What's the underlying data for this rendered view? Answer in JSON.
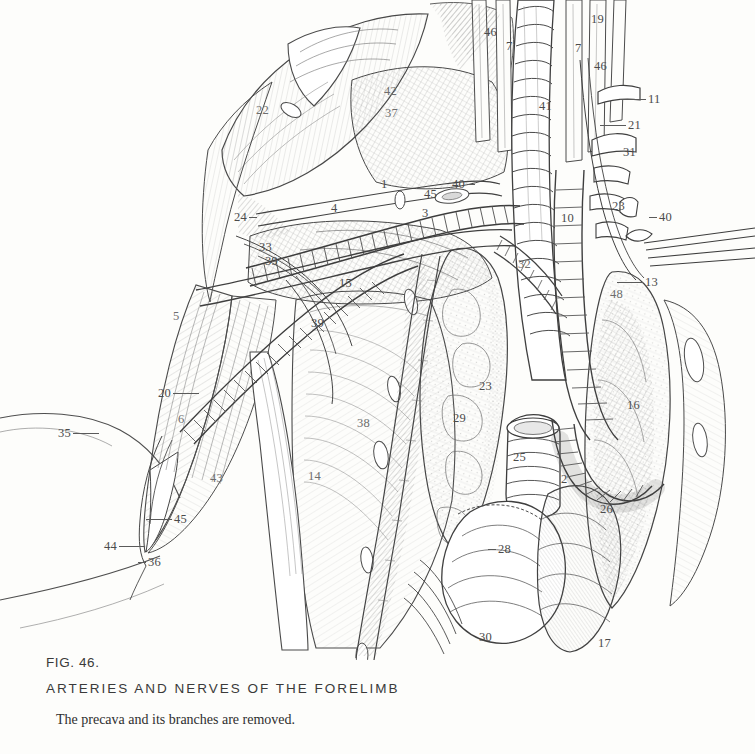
{
  "figure": {
    "number": "FIG. 46.",
    "title": "ARTERIES AND NERVES OF THE FORELIMB",
    "subtitle": "The precava and its branches are removed.",
    "media": "pen-and-ink anatomical line engraving"
  },
  "ink": {
    "line": "#3a3a3a",
    "label": "#4b4b4b",
    "hatch": "#6b6b6b",
    "paper": "#fdfdfb"
  },
  "labels": [
    {
      "id": "l-46a",
      "text": "46",
      "x": 484,
      "y": 26,
      "lead": "lead-r short"
    },
    {
      "id": "l-7a",
      "text": "7",
      "x": 506,
      "y": 40,
      "lead": ""
    },
    {
      "id": "l-19",
      "text": "19",
      "x": 591,
      "y": 13,
      "lead": ""
    },
    {
      "id": "l-7b",
      "text": "7",
      "x": 575,
      "y": 42,
      "lead": ""
    },
    {
      "id": "l-46b",
      "text": "46",
      "x": 594,
      "y": 60,
      "lead": ""
    },
    {
      "id": "l-41",
      "text": "41",
      "x": 539,
      "y": 100,
      "lead": ""
    },
    {
      "id": "l-11",
      "text": "11",
      "x": 648,
      "y": 93,
      "lead": "lead-l long"
    },
    {
      "id": "l-21",
      "text": "21",
      "x": 628,
      "y": 119,
      "lead": "lead-l long"
    },
    {
      "id": "l-31",
      "text": "31",
      "x": 623,
      "y": 146,
      "lead": ""
    },
    {
      "id": "l-23a",
      "text": "23",
      "x": 612,
      "y": 200,
      "lead": ""
    },
    {
      "id": "l-10",
      "text": "10",
      "x": 561,
      "y": 212,
      "lead": ""
    },
    {
      "id": "l-40c",
      "text": "40",
      "x": 659,
      "y": 211,
      "lead": "lead-l short"
    },
    {
      "id": "l-13",
      "text": "13",
      "x": 645,
      "y": 276,
      "lead": "lead-l long"
    },
    {
      "id": "l-48",
      "text": "48",
      "x": 610,
      "y": 288,
      "lead": ""
    },
    {
      "id": "l-16",
      "text": "16",
      "x": 627,
      "y": 399,
      "lead": ""
    },
    {
      "id": "l-22",
      "text": "22",
      "x": 256,
      "y": 104,
      "lead": ""
    },
    {
      "id": "l-42",
      "text": "42",
      "x": 384,
      "y": 85,
      "lead": ""
    },
    {
      "id": "l-37",
      "text": "37",
      "x": 385,
      "y": 107,
      "lead": ""
    },
    {
      "id": "l-1",
      "text": "1",
      "x": 381,
      "y": 178,
      "lead": ""
    },
    {
      "id": "l-45a",
      "text": "45",
      "x": 424,
      "y": 188,
      "lead": ""
    },
    {
      "id": "l-40a",
      "text": "40",
      "x": 452,
      "y": 178,
      "lead": "lead-r short"
    },
    {
      "id": "l-3",
      "text": "3",
      "x": 422,
      "y": 207,
      "lead": ""
    },
    {
      "id": "l-24",
      "text": "24",
      "x": 234,
      "y": 211,
      "lead": "lead-r short"
    },
    {
      "id": "l-33",
      "text": "33",
      "x": 259,
      "y": 241,
      "lead": ""
    },
    {
      "id": "l-39a",
      "text": "39",
      "x": 265,
      "y": 255,
      "lead": ""
    },
    {
      "id": "l-4",
      "text": "4",
      "x": 331,
      "y": 202,
      "lead": ""
    },
    {
      "id": "l-15",
      "text": "15",
      "x": 339,
      "y": 277,
      "lead": ""
    },
    {
      "id": "l-32",
      "text": "32",
      "x": 518,
      "y": 258,
      "lead": ""
    },
    {
      "id": "l-5",
      "text": "5",
      "x": 173,
      "y": 310,
      "lead": ""
    },
    {
      "id": "l-39b",
      "text": "39",
      "x": 311,
      "y": 317,
      "lead": ""
    },
    {
      "id": "l-20",
      "text": "20",
      "x": 158,
      "y": 387,
      "lead": "lead-r long"
    },
    {
      "id": "l-6",
      "text": "6",
      "x": 178,
      "y": 413,
      "lead": ""
    },
    {
      "id": "l-35",
      "text": "35",
      "x": 58,
      "y": 427,
      "lead": "lead-r long"
    },
    {
      "id": "l-43",
      "text": "43",
      "x": 210,
      "y": 472,
      "lead": ""
    },
    {
      "id": "l-45b",
      "text": "45",
      "x": 174,
      "y": 513,
      "lead": "lead-l long"
    },
    {
      "id": "l-44",
      "text": "44",
      "x": 104,
      "y": 540,
      "lead": "lead-r long"
    },
    {
      "id": "l-36",
      "text": "36",
      "x": 148,
      "y": 556,
      "lead": "lead-l short"
    },
    {
      "id": "l-38",
      "text": "38",
      "x": 357,
      "y": 417,
      "lead": ""
    },
    {
      "id": "l-14",
      "text": "14",
      "x": 308,
      "y": 470,
      "lead": ""
    },
    {
      "id": "l-23b",
      "text": "23",
      "x": 479,
      "y": 380,
      "lead": ""
    },
    {
      "id": "l-29a",
      "text": "29",
      "x": 453,
      "y": 412,
      "lead": ""
    },
    {
      "id": "l-25",
      "text": "25",
      "x": 513,
      "y": 451,
      "lead": ""
    },
    {
      "id": "l-2",
      "text": "2",
      "x": 561,
      "y": 473,
      "lead": ""
    },
    {
      "id": "l-26",
      "text": "26",
      "x": 600,
      "y": 503,
      "lead": ""
    },
    {
      "id": "l-28",
      "text": "28",
      "x": 498,
      "y": 543,
      "lead": "lead-l short"
    },
    {
      "id": "l-30",
      "text": "30",
      "x": 479,
      "y": 631,
      "lead": ""
    },
    {
      "id": "l-17",
      "text": "17",
      "x": 598,
      "y": 637,
      "lead": ""
    }
  ]
}
